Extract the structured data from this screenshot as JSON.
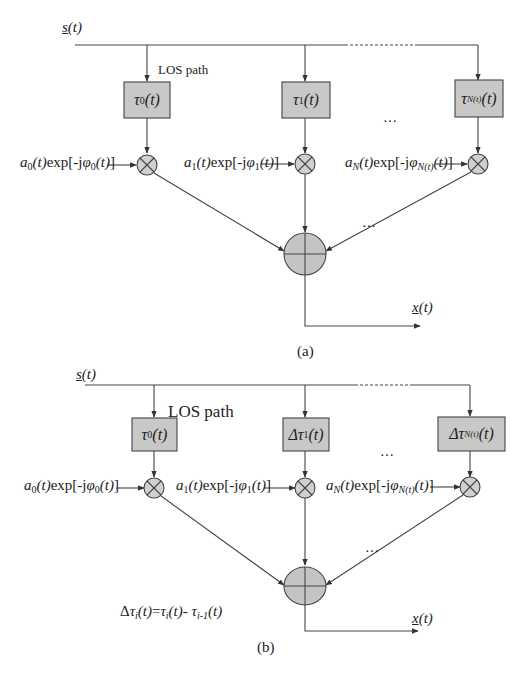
{
  "figure": {
    "panel_a": {
      "input_label": "s(t)",
      "los_label": "LOS path",
      "delay_blocks": [
        {
          "symbol": "τ",
          "sub": "0",
          "arg": "(t)"
        },
        {
          "symbol": "τ",
          "sub": "1",
          "arg": "(t)"
        },
        {
          "symbol": "τ",
          "sub": "N(t)",
          "arg": "(t)"
        }
      ],
      "gains": [
        {
          "a_sub": "0",
          "phi_sub": "0",
          "text": "a0(t)exp[-jφ0(t)]"
        },
        {
          "a_sub": "1",
          "phi_sub": "1",
          "text": "a1(t)exp[-jφ1(t)]"
        },
        {
          "a_sub": "N",
          "phi_sub": "N(t)",
          "text": "aN(t)exp[-jφN(t)(t)]"
        }
      ],
      "ellipsis": "…",
      "output_label": "x(t)",
      "caption": "(a)"
    },
    "panel_b": {
      "input_label": "s(t)",
      "los_label": "LOS path",
      "delay_blocks": [
        {
          "symbol": "τ",
          "sub": "0",
          "arg": "(t)",
          "prefix": ""
        },
        {
          "symbol": "τ",
          "sub": "1",
          "arg": "(t)",
          "prefix": "Δ"
        },
        {
          "symbol": "τ",
          "sub": "N(t)",
          "arg": "(t)",
          "prefix": "Δ"
        }
      ],
      "gains": [
        {
          "a_sub": "0",
          "phi_sub": "0",
          "text": "a0(t)exp[-jφ0(t)]"
        },
        {
          "a_sub": "1",
          "phi_sub": "1",
          "text": "a1(t)exp[-jφ1(t)]"
        },
        {
          "a_sub": "N",
          "phi_sub": "N(t)",
          "text": "aN(t)exp[-jφN(t)(t)]"
        }
      ],
      "ellipsis": "…",
      "formula": "Δτi(t)=τi(t)- τi-1(t)",
      "output_label": "x(t)",
      "caption": "(b)"
    },
    "colors": {
      "block_fill": "#c8c8c8",
      "line": "#444444",
      "multiplier_fill": "#d0d0d0",
      "adder_fill": "#c4c4c4"
    },
    "text": {
      "s": "s",
      "t": "(t)",
      "x": "x",
      "tau": "τ",
      "delta": "Δ",
      "a": "a",
      "exp": "exp[-j",
      "phi": "φ",
      "close": "]",
      "sub0": "0",
      "sub1": "1",
      "subN": "N",
      "subNt": "N(t)",
      "eq": "=",
      "minus": "- ",
      "subi": "i",
      "subi1": "i-1"
    }
  }
}
